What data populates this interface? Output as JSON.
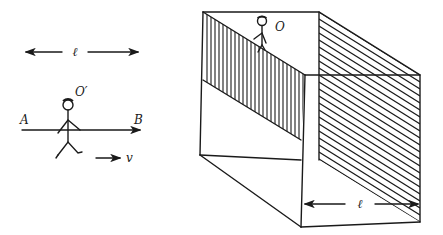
{
  "left_figure": {
    "length_label": "ℓ",
    "observer_label": "O′",
    "point_a_label": "A",
    "point_b_label": "B",
    "velocity_label": "v"
  },
  "right_figure": {
    "observer_label": "O",
    "length_label": "ℓ"
  },
  "colors": {
    "ink": "#1a1a1a",
    "background": "#ffffff"
  }
}
